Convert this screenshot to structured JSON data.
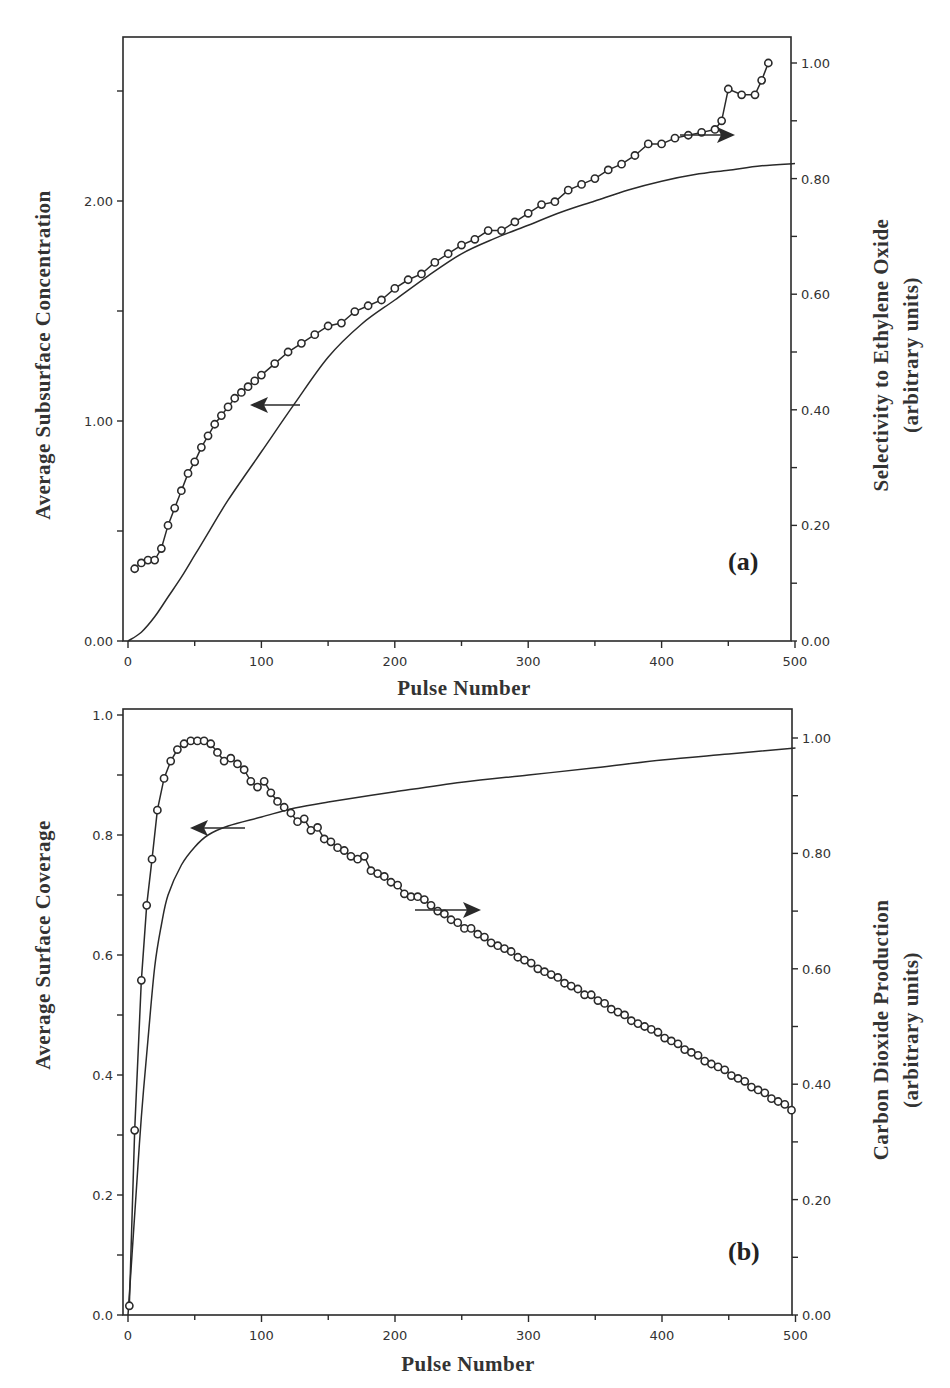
{
  "chart_data": [
    {
      "panel": "(a)",
      "type": "line",
      "xlabel": "Pulse Number",
      "xlim": [
        0,
        500
      ],
      "xticks": [
        0,
        100,
        200,
        300,
        400,
        500
      ],
      "ylabel_left": "Average Subsurface Concentration",
      "ylim_left": [
        0,
        2.63
      ],
      "yticks_left": [
        "0.00",
        "1.00",
        "2.00"
      ],
      "ylabel_right": "Selectivity to Ethylene Oxide (arbitrary units)",
      "ylim_right": [
        0,
        1.06
      ],
      "yticks_right": [
        "0.00",
        "0.20",
        "0.40",
        "0.60",
        "0.80",
        "1.00"
      ],
      "series": [
        {
          "name": "Average Subsurface Concentration",
          "axis": "left",
          "style": "solid-line",
          "x": [
            0,
            10,
            20,
            30,
            40,
            50,
            60,
            75,
            100,
            125,
            150,
            175,
            200,
            225,
            250,
            275,
            300,
            325,
            350,
            375,
            400,
            425,
            450,
            475,
            500
          ],
          "y": [
            0.0,
            0.04,
            0.11,
            0.2,
            0.29,
            0.39,
            0.49,
            0.64,
            0.86,
            1.08,
            1.29,
            1.44,
            1.55,
            1.66,
            1.76,
            1.83,
            1.89,
            1.95,
            2.0,
            2.05,
            2.09,
            2.12,
            2.14,
            2.16,
            2.17
          ]
        },
        {
          "name": "Selectivity to Ethylene Oxide",
          "axis": "right",
          "style": "line-with-open-circles",
          "x": [
            5,
            10,
            15,
            20,
            25,
            30,
            35,
            40,
            45,
            50,
            55,
            60,
            65,
            70,
            75,
            80,
            85,
            90,
            95,
            100,
            110,
            120,
            130,
            140,
            150,
            160,
            170,
            180,
            190,
            200,
            210,
            220,
            230,
            240,
            250,
            260,
            270,
            280,
            290,
            300,
            310,
            320,
            330,
            340,
            350,
            360,
            370,
            380,
            390,
            400,
            410,
            420,
            430,
            440,
            445,
            450,
            460,
            470,
            475,
            480
          ],
          "y": [
            0.125,
            0.135,
            0.14,
            0.14,
            0.16,
            0.2,
            0.23,
            0.26,
            0.29,
            0.31,
            0.335,
            0.355,
            0.375,
            0.39,
            0.405,
            0.42,
            0.43,
            0.44,
            0.45,
            0.46,
            0.48,
            0.5,
            0.515,
            0.53,
            0.545,
            0.55,
            0.57,
            0.58,
            0.59,
            0.61,
            0.625,
            0.635,
            0.655,
            0.67,
            0.685,
            0.695,
            0.71,
            0.71,
            0.725,
            0.74,
            0.755,
            0.76,
            0.78,
            0.79,
            0.8,
            0.815,
            0.825,
            0.84,
            0.86,
            0.86,
            0.87,
            0.875,
            0.88,
            0.885,
            0.9,
            0.955,
            0.945,
            0.945,
            0.97,
            1.0
          ]
        }
      ],
      "annotations": [
        "left arrow pointing to concentration axis",
        "right arrow pointing to selectivity axis"
      ]
    },
    {
      "panel": "(b)",
      "type": "line",
      "xlabel": "Pulse Number",
      "xlim": [
        0,
        500
      ],
      "xticks": [
        0,
        100,
        200,
        300,
        400,
        500
      ],
      "ylabel_left": "Average Surface Coverage",
      "ylim_left": [
        0,
        1.0
      ],
      "yticks_left": [
        "0.0",
        "0.2",
        "0.4",
        "0.6",
        "0.8",
        "1.0"
      ],
      "ylabel_right": "Carbon Dioxide Production (arbitrary units)",
      "ylim_right": [
        0,
        1.04
      ],
      "yticks_right": [
        "0.00",
        "0.20",
        "0.40",
        "0.60",
        "0.80",
        "1.00"
      ],
      "series": [
        {
          "name": "Average Surface Coverage",
          "axis": "left",
          "style": "solid-line",
          "x": [
            0,
            3,
            6,
            10,
            15,
            20,
            25,
            30,
            40,
            50,
            60,
            75,
            100,
            125,
            150,
            200,
            250,
            300,
            350,
            400,
            450,
            500
          ],
          "y": [
            0.0,
            0.1,
            0.2,
            0.33,
            0.46,
            0.58,
            0.65,
            0.7,
            0.75,
            0.78,
            0.8,
            0.815,
            0.83,
            0.845,
            0.855,
            0.872,
            0.888,
            0.9,
            0.912,
            0.925,
            0.935,
            0.945
          ]
        },
        {
          "name": "Carbon Dioxide Production",
          "axis": "right",
          "style": "line-with-open-circles",
          "x": [
            1,
            5,
            10,
            14,
            18,
            22,
            27,
            32,
            37,
            42,
            47,
            52,
            57,
            62,
            67,
            72,
            77,
            82,
            87,
            92,
            97,
            102,
            107,
            112,
            117,
            122,
            127,
            132,
            137,
            142,
            147,
            152,
            157,
            162,
            167,
            172,
            177,
            182,
            187,
            192,
            197,
            202,
            207,
            212,
            217,
            222,
            227,
            232,
            237,
            242,
            247,
            252,
            257,
            262,
            267,
            272,
            277,
            282,
            287,
            292,
            297,
            302,
            307,
            312,
            317,
            322,
            327,
            332,
            337,
            342,
            347,
            352,
            357,
            362,
            367,
            372,
            377,
            382,
            387,
            392,
            397,
            402,
            407,
            412,
            417,
            422,
            427,
            432,
            437,
            442,
            447,
            452,
            457,
            462,
            467,
            472,
            477,
            482,
            487,
            492,
            497
          ],
          "y": [
            0.016,
            0.32,
            0.58,
            0.71,
            0.79,
            0.875,
            0.93,
            0.96,
            0.98,
            0.99,
            0.995,
            0.995,
            0.995,
            0.99,
            0.975,
            0.96,
            0.965,
            0.955,
            0.945,
            0.925,
            0.915,
            0.925,
            0.905,
            0.89,
            0.88,
            0.87,
            0.855,
            0.86,
            0.84,
            0.845,
            0.825,
            0.82,
            0.81,
            0.805,
            0.795,
            0.79,
            0.795,
            0.77,
            0.765,
            0.76,
            0.75,
            0.745,
            0.73,
            0.725,
            0.725,
            0.72,
            0.71,
            0.7,
            0.695,
            0.685,
            0.68,
            0.67,
            0.67,
            0.66,
            0.655,
            0.645,
            0.64,
            0.635,
            0.63,
            0.62,
            0.615,
            0.61,
            0.6,
            0.595,
            0.59,
            0.585,
            0.575,
            0.57,
            0.565,
            0.555,
            0.555,
            0.545,
            0.54,
            0.53,
            0.525,
            0.52,
            0.51,
            0.505,
            0.5,
            0.495,
            0.49,
            0.48,
            0.475,
            0.47,
            0.46,
            0.455,
            0.45,
            0.44,
            0.435,
            0.43,
            0.425,
            0.415,
            0.41,
            0.405,
            0.395,
            0.39,
            0.385,
            0.375,
            0.37,
            0.365,
            0.355
          ]
        }
      ],
      "annotations": [
        "left arrow pointing to coverage axis",
        "right arrow pointing to CO2 production axis"
      ]
    }
  ],
  "panels": {
    "a": {
      "label": "(a)",
      "xlabel": "Pulse Number",
      "ylabel_left": "Average  Subsurface  Concentration",
      "ylabel_right_1": "Selectivity  to  Ethylene  Oxide",
      "ylabel_right_2": "(arbitrary  units)",
      "xticks": [
        "0",
        "100",
        "200",
        "300",
        "400",
        "500"
      ],
      "yticks_left": [
        "0.00",
        "1.00",
        "2.00"
      ],
      "yticks_right": [
        "0.00",
        "0.20",
        "0.40",
        "0.60",
        "0.80",
        "1.00"
      ]
    },
    "b": {
      "label": "(b)",
      "xlabel": "Pulse Number",
      "ylabel_left": "Average  Surface  Coverage",
      "ylabel_right_1": "Carbon  Dioxide  Production",
      "ylabel_right_2": "(arbitrary  units)",
      "xticks": [
        "0",
        "100",
        "200",
        "300",
        "400",
        "500"
      ],
      "yticks_left": [
        "0.0",
        "0.2",
        "0.4",
        "0.6",
        "0.8",
        "1.0"
      ],
      "yticks_right": [
        "0.00",
        "0.20",
        "0.40",
        "0.60",
        "0.80",
        "1.00"
      ]
    }
  },
  "colors": {
    "ink": "#2a2a2a",
    "background": "#ffffff"
  }
}
